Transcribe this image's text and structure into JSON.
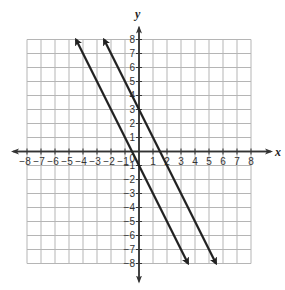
{
  "chart_data": {
    "type": "line",
    "title": "",
    "xlabel": "x",
    "ylabel": "y",
    "xlim": [
      -8,
      8
    ],
    "ylim": [
      -8,
      8
    ],
    "grid": true,
    "x_ticks": [
      -8,
      -7,
      -6,
      -5,
      -4,
      -3,
      -2,
      -1,
      1,
      2,
      3,
      4,
      5,
      6,
      7,
      8
    ],
    "y_ticks": [
      -8,
      -7,
      -6,
      -5,
      -4,
      -3,
      -2,
      -1,
      1,
      2,
      3,
      4,
      5,
      6,
      7,
      8
    ],
    "origin_label": "0",
    "series": [
      {
        "name": "line-1",
        "equation": "y = -2x - 1",
        "slope": -2,
        "intercept": -1,
        "x": [
          -4.5,
          3.5
        ],
        "y": [
          8,
          -8
        ],
        "arrows": "both"
      },
      {
        "name": "line-2",
        "equation": "y = -2x + 3",
        "slope": -2,
        "intercept": 3,
        "x": [
          -2.5,
          5.5
        ],
        "y": [
          8,
          -8
        ],
        "arrows": "both"
      }
    ],
    "colors": {
      "grid": "#b5b5b5",
      "axis": "#333333",
      "line": "#222222"
    }
  }
}
